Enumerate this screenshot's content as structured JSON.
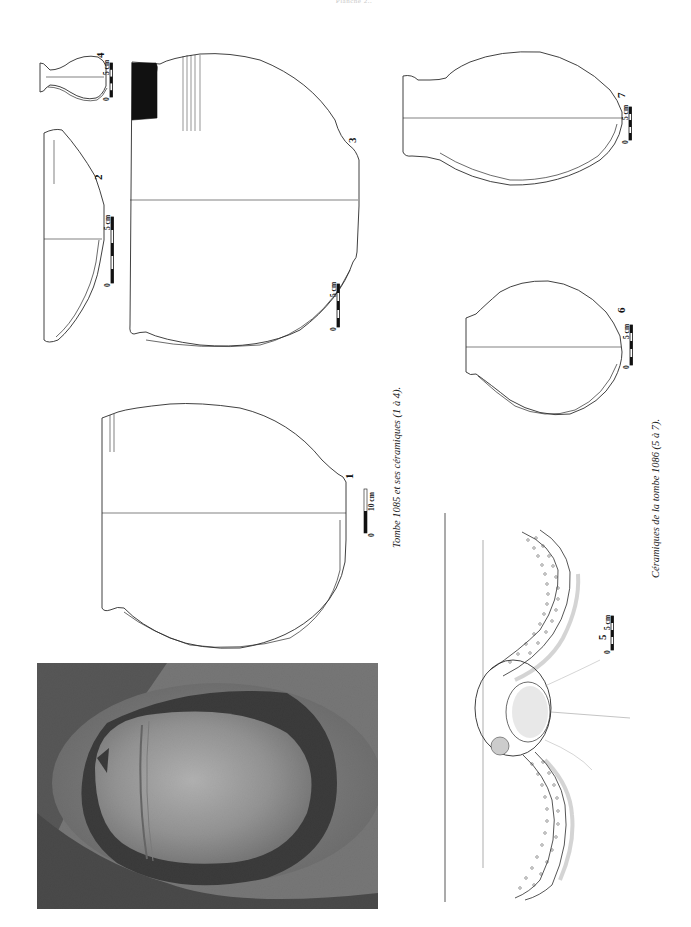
{
  "page": {
    "header_text": "Planche 2..",
    "background": "#ffffff"
  },
  "figures": [
    {
      "id": "tombe-1085",
      "caption": "Tombe 1085 et ses céramiques (1 à 4).",
      "items": [
        {
          "number": "1",
          "scale_label": "0",
          "scale_unit": "10 cm",
          "type": "jar profile drawing"
        },
        {
          "number": "2",
          "scale_label": "0",
          "scale_unit": "5 cm",
          "type": "bowl profile drawing"
        },
        {
          "number": "3",
          "scale_label": "0",
          "scale_unit": "5 cm",
          "type": "large jar profile drawing with dark rim section and ribbing"
        },
        {
          "number": "4",
          "scale_label": "0",
          "scale_unit": "5 cm",
          "type": "small flask profile drawing"
        }
      ],
      "photo": {
        "description": "in-situ photograph of a large jar lying in the grave pit"
      }
    },
    {
      "id": "tombe-1086",
      "caption": "Céramiques de la tombe 1086 (5 à 7).",
      "items": [
        {
          "number": "5",
          "scale_label": "0",
          "scale_unit": "5 cm",
          "type": "plan drawing of vessel with snake-like dotted handles"
        },
        {
          "number": "6",
          "scale_label": "0",
          "scale_unit": "5 cm",
          "type": "jar profile drawing"
        },
        {
          "number": "7",
          "scale_label": "0",
          "scale_unit": "5 cm",
          "type": "jug profile drawing"
        }
      ]
    }
  ],
  "colors": {
    "line": "#2b2b2b",
    "fill_section": "#111111",
    "photo_dark": "#1a1a1a",
    "photo_light": "#b8b8b8"
  }
}
